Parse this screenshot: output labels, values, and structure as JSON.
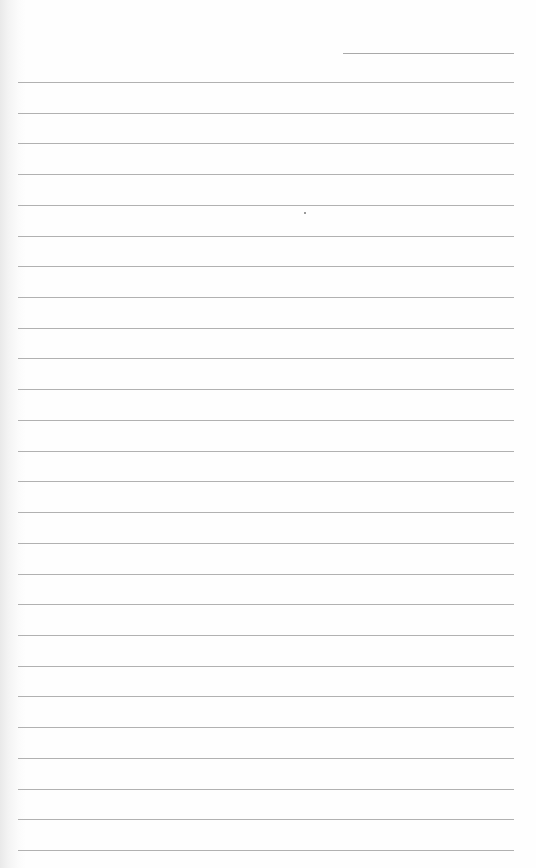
{
  "page": {
    "type": "blank-ruled-notebook-page",
    "background": "#fefefe",
    "line_color": "#b1b1b1"
  },
  "header_line": {
    "x1": 343,
    "x2": 514,
    "y": 53
  },
  "rules": {
    "count": 26,
    "first_y": 82,
    "spacing": 30.72,
    "x1": 18,
    "x2": 514
  },
  "marks": [
    {
      "x": 304,
      "y": 212
    }
  ]
}
